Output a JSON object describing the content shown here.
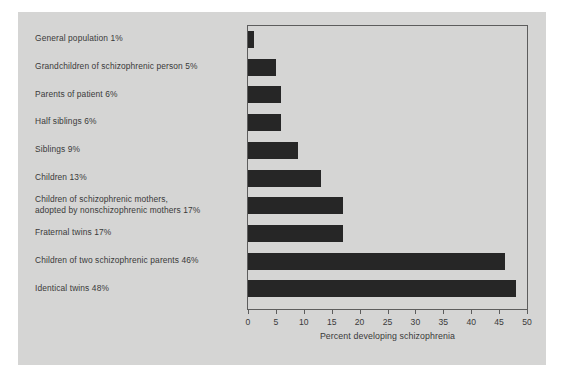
{
  "chart_data": {
    "type": "bar",
    "orientation": "horizontal",
    "title": "",
    "xlabel": "Percent developing schizophrenia",
    "ylabel": "",
    "xlim": [
      0,
      50
    ],
    "xticks": [
      0,
      5,
      10,
      15,
      20,
      25,
      30,
      35,
      40,
      45,
      50
    ],
    "grid": false,
    "legend": null,
    "colors": {
      "background": "#d5d5d4",
      "bar": "#262626",
      "frame": "#5d5d5d",
      "text": "#3a3a3a",
      "page": "#ffffff"
    },
    "categories": [
      "General population",
      "Grandchildren of schizophrenic person",
      "Parents of patient",
      "Half siblings",
      "Siblings",
      "Children",
      "Children of schizophrenic mothers, adopted by nonschizophrenic mothers",
      "Fraternal twins",
      "Children of two schizophrenic parents",
      "Identical twins"
    ],
    "values": [
      1,
      5,
      6,
      6,
      9,
      13,
      17,
      17,
      46,
      48
    ],
    "rows": [
      {
        "label": "General population 1%",
        "value": 1
      },
      {
        "label": "Grandchildren of schizophrenic person 5%",
        "value": 5
      },
      {
        "label": "Parents of patient 6%",
        "value": 6
      },
      {
        "label": "Half siblings 6%",
        "value": 6
      },
      {
        "label": "Siblings 9%",
        "value": 9
      },
      {
        "label": "Children 13%",
        "value": 13
      },
      {
        "label": "Children of schizophrenic mothers,\nadopted by nonschizophrenic mothers 17%",
        "value": 17
      },
      {
        "label": "Fraternal twins 17%",
        "value": 17
      },
      {
        "label": "Children of two schizophrenic parents 46%",
        "value": 46
      },
      {
        "label": "Identical twins 48%",
        "value": 48
      }
    ],
    "tick_labels": [
      "0",
      "5",
      "10",
      "15",
      "20",
      "25",
      "30",
      "35",
      "40",
      "45",
      "50"
    ]
  }
}
